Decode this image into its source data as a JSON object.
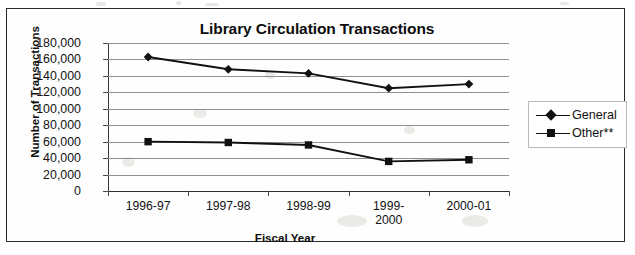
{
  "chart_data": {
    "type": "line",
    "title": "Library Circulation Transactions",
    "xlabel": "Fiscal Year",
    "ylabel": "Number of Transactions",
    "categories": [
      "1996-97",
      "1997-98",
      "1998-99",
      "1999-\n2000",
      "2000-01"
    ],
    "ylim": [
      0,
      180000
    ],
    "ytick_step": 20000,
    "ytick_labels": [
      "180,000",
      "160,000",
      "140,000",
      "120,000",
      "100,000",
      "80,000",
      "60,000",
      "40,000",
      "20,000",
      "0"
    ],
    "ytick_values": [
      180000,
      160000,
      140000,
      120000,
      100000,
      80000,
      60000,
      40000,
      20000,
      0
    ],
    "grid": true,
    "legend_position": "right",
    "series": [
      {
        "name": "General",
        "marker": "diamond",
        "color": "#111111",
        "values": [
          163000,
          148000,
          143000,
          125000,
          130000
        ]
      },
      {
        "name": "Other**",
        "marker": "square",
        "color": "#111111",
        "values": [
          60000,
          59000,
          56000,
          36000,
          38000
        ]
      }
    ]
  },
  "legend": {
    "entries": [
      {
        "label": "General",
        "marker": "diamond"
      },
      {
        "label": "Other**",
        "marker": "square"
      }
    ]
  }
}
